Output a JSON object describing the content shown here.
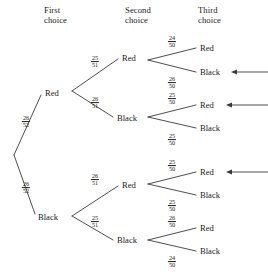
{
  "diagram": {
    "headers": [
      {
        "name": "first-choice",
        "text": "First\nchoice",
        "x": 44,
        "y": 5
      },
      {
        "name": "second-choice",
        "text": "Second\nchoice",
        "x": 125,
        "y": 5
      },
      {
        "name": "third-choice",
        "text": "Third\nchoice",
        "x": 198,
        "y": 5
      }
    ],
    "colors": {
      "line": "#3a3a3a",
      "text": "#1a1a1a",
      "background": "#ffffff"
    },
    "root": {
      "x": 14,
      "y": 155
    },
    "level1": [
      {
        "name": "first-red",
        "label": "Red",
        "x": 45,
        "y": 93,
        "node_x": 70,
        "fraction": {
          "num": "26",
          "den": "52"
        },
        "frac_x": 26,
        "frac_y": 122
      },
      {
        "name": "first-black",
        "label": "Black",
        "x": 38,
        "y": 217,
        "node_x": 70,
        "fraction": {
          "num": "26",
          "den": "52"
        },
        "frac_x": 26,
        "frac_y": 188
      }
    ],
    "level2": [
      {
        "name": "second-red-from-red",
        "label": "Red",
        "x": 122,
        "y": 58,
        "parent": "first-red",
        "fraction": {
          "num": "25",
          "den": "51"
        },
        "frac_x": 95,
        "frac_y": 62
      },
      {
        "name": "second-black-from-red",
        "label": "Black",
        "x": 117,
        "y": 118,
        "parent": "first-red",
        "fraction": {
          "num": "26",
          "den": "51"
        },
        "frac_x": 95,
        "frac_y": 103
      },
      {
        "name": "second-red-from-black",
        "label": "Red",
        "x": 122,
        "y": 185,
        "parent": "first-black",
        "fraction": {
          "num": "26",
          "den": "51"
        },
        "frac_x": 95,
        "frac_y": 180
      },
      {
        "name": "second-black-from-black",
        "label": "Black",
        "x": 117,
        "y": 240,
        "parent": "first-black",
        "fraction": {
          "num": "25",
          "den": "51"
        },
        "frac_x": 95,
        "frac_y": 222
      }
    ],
    "level3": [
      {
        "name": "third-red-rr",
        "label": "Red",
        "x": 200,
        "y": 48,
        "fraction": {
          "num": "24",
          "den": "50"
        },
        "frac_x": 172,
        "frac_y": 42,
        "arrow": false
      },
      {
        "name": "third-black-rr",
        "label": "Black",
        "x": 200,
        "y": 72,
        "fraction": {
          "num": "26",
          "den": "50"
        },
        "frac_x": 172,
        "frac_y": 83,
        "arrow": true
      },
      {
        "name": "third-red-rb",
        "label": "Red",
        "x": 200,
        "y": 105,
        "fraction": {
          "num": "25",
          "den": "50"
        },
        "frac_x": 172,
        "frac_y": 99,
        "arrow": true
      },
      {
        "name": "third-black-rb",
        "label": "Black",
        "x": 200,
        "y": 128,
        "fraction": {
          "num": "25",
          "den": "50"
        },
        "frac_x": 172,
        "frac_y": 140,
        "arrow": false
      },
      {
        "name": "third-red-br",
        "label": "Red",
        "x": 200,
        "y": 172,
        "fraction": {
          "num": "25",
          "den": "50"
        },
        "frac_x": 172,
        "frac_y": 166,
        "arrow": true
      },
      {
        "name": "third-black-br",
        "label": "Black",
        "x": 200,
        "y": 195,
        "fraction": {
          "num": "25",
          "den": "50"
        },
        "frac_x": 172,
        "frac_y": 206,
        "arrow": false
      },
      {
        "name": "third-red-bb",
        "label": "Red",
        "x": 200,
        "y": 228,
        "fraction": {
          "num": "26",
          "den": "50"
        },
        "frac_x": 172,
        "frac_y": 222,
        "arrow": false
      },
      {
        "name": "third-black-bb",
        "label": "Black",
        "x": 200,
        "y": 251,
        "fraction": {
          "num": "24",
          "den": "50"
        },
        "frac_x": 172,
        "frac_y": 262,
        "arrow": false
      }
    ],
    "arrows": [
      {
        "name": "arrow-black-rr",
        "y": 72,
        "x_start": 268,
        "x_end": 231
      },
      {
        "name": "arrow-red-rb",
        "y": 105,
        "x_start": 268,
        "x_end": 226
      },
      {
        "name": "arrow-red-br",
        "y": 172,
        "x_start": 268,
        "x_end": 226
      }
    ]
  }
}
